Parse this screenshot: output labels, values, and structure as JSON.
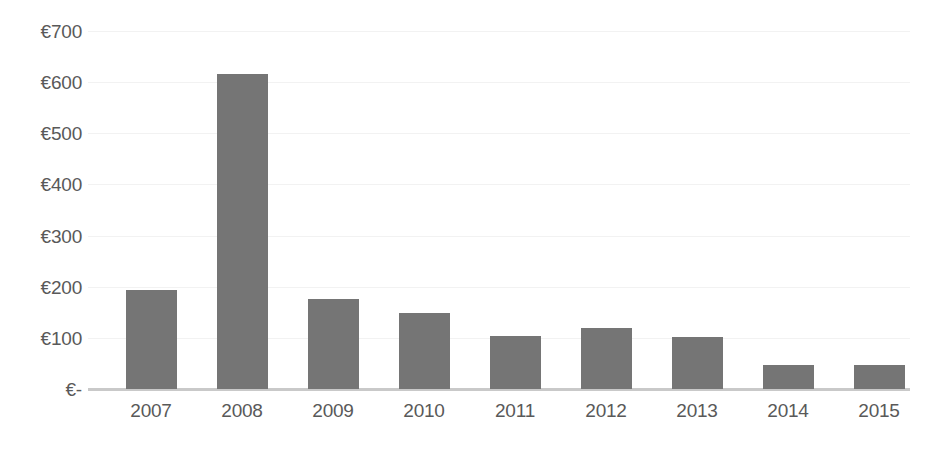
{
  "chart_data": {
    "type": "bar",
    "title": "",
    "subtitle": "",
    "xlabel": "",
    "ylabel": "",
    "categories": [
      "2007",
      "2008",
      "2009",
      "2010",
      "2011",
      "2012",
      "2013",
      "2014",
      "2015"
    ],
    "values": [
      193,
      616,
      176,
      148,
      103,
      120,
      101,
      47,
      47
    ],
    "series": [
      {
        "name": "",
        "values": [
          193,
          616,
          176,
          148,
          103,
          120,
          101,
          47,
          47
        ]
      }
    ],
    "ylim": [
      0,
      700
    ],
    "ytick_values": [
      700,
      600,
      500,
      400,
      300,
      200,
      100,
      0
    ],
    "ytick_labels": [
      "€700",
      "€600",
      "€500",
      "€400",
      "€300",
      "€200",
      "€100",
      "€-"
    ],
    "grid": true,
    "legend": false,
    "legend_position": "none",
    "currency_symbol": "€",
    "colors": {
      "bar": "#757575",
      "gridline": "#f2f2f2",
      "axis_line": "#c9c9c9",
      "tick_label": "#595959",
      "background": "#ffffff"
    }
  }
}
